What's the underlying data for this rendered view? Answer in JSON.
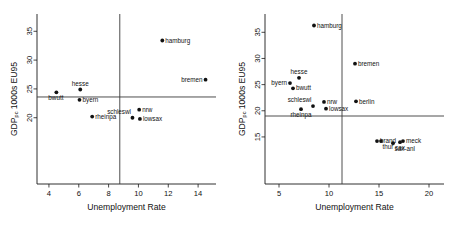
{
  "figure": {
    "panel_count": 2,
    "background_color": "#ffffff",
    "point_color": "#111111",
    "axis_color": "#1a1a1a",
    "refline_color": "#3a3a3a"
  },
  "chart_data": [
    {
      "type": "scatter",
      "panel": "left",
      "title": "",
      "xlabel": "Unemployment Rate",
      "ylabel": "GDP",
      "ylabel_sub": "pc",
      "ylabel_tail": " 1000s EU95",
      "ylabel_full": "GDP pc 1000s EU95",
      "xlim": [
        3.2,
        15.2
      ],
      "ylim": [
        8.5,
        38.0
      ],
      "xticks": [
        4,
        6,
        8,
        10,
        12,
        14
      ],
      "yticks": [
        20,
        25,
        30,
        35
      ],
      "grid": false,
      "legend": "none",
      "reference_lines": {
        "vertical_x": 8.75,
        "horizontal_y": 23.6
      },
      "points": [
        {
          "label": "bwutt",
          "x": 4.5,
          "y": 24.4,
          "label_pos": "below-left"
        },
        {
          "label": "byern",
          "x": 6.05,
          "y": 23.1,
          "label_pos": "right"
        },
        {
          "label": "hesse",
          "x": 6.1,
          "y": 24.9,
          "label_pos": "above"
        },
        {
          "label": "rheinpa",
          "x": 6.9,
          "y": 20.2,
          "label_pos": "right"
        },
        {
          "label": "schleswl",
          "x": 9.6,
          "y": 20.0,
          "label_pos": "above-left"
        },
        {
          "label": "nrw",
          "x": 10.05,
          "y": 21.4,
          "label_pos": "right"
        },
        {
          "label": "lowsax",
          "x": 10.1,
          "y": 19.8,
          "label_pos": "right"
        },
        {
          "label": "hamburg",
          "x": 11.6,
          "y": 33.4,
          "label_pos": "right"
        },
        {
          "label": "bremen",
          "x": 14.5,
          "y": 26.6,
          "label_pos": "left"
        }
      ]
    },
    {
      "type": "scatter",
      "panel": "right",
      "title": "",
      "xlabel": "Unemployment Rate",
      "ylabel": "GDP",
      "ylabel_sub": "pc",
      "ylabel_tail": " 1000s EU95",
      "ylabel_full": "GDP pc 1000s EU95",
      "xlim": [
        3.6,
        21.5
      ],
      "ylim": [
        6.0,
        38.5
      ],
      "xticks": [
        5,
        10,
        15,
        20
      ],
      "yticks": [
        15,
        20,
        25,
        30,
        35
      ],
      "grid": false,
      "legend": "none",
      "reference_lines": {
        "vertical_x": 11.3,
        "horizontal_y": 19.0
      },
      "points": [
        {
          "label": "byern",
          "x": 6.1,
          "y": 25.3,
          "label_pos": "left"
        },
        {
          "label": "bwutt",
          "x": 6.4,
          "y": 24.3,
          "label_pos": "right"
        },
        {
          "label": "hesse",
          "x": 7.0,
          "y": 26.3,
          "label_pos": "above"
        },
        {
          "label": "rheinpa",
          "x": 7.2,
          "y": 20.3,
          "label_pos": "below"
        },
        {
          "label": "schleswl",
          "x": 8.4,
          "y": 20.9,
          "label_pos": "above-left"
        },
        {
          "label": "hamburg",
          "x": 8.5,
          "y": 36.3,
          "label_pos": "right"
        },
        {
          "label": "nrw",
          "x": 9.5,
          "y": 21.7,
          "label_pos": "right"
        },
        {
          "label": "lowsax",
          "x": 9.7,
          "y": 20.4,
          "label_pos": "right"
        },
        {
          "label": "bremen",
          "x": 12.6,
          "y": 29.0,
          "label_pos": "right"
        },
        {
          "label": "berlin",
          "x": 12.7,
          "y": 21.8,
          "label_pos": "right"
        },
        {
          "label": "brand",
          "x": 14.8,
          "y": 14.2,
          "label_pos": "right"
        },
        {
          "label": "thur",
          "x": 15.2,
          "y": 14.2,
          "label_pos": "below-right"
        },
        {
          "label": "sax-anl",
          "x": 16.4,
          "y": 13.8,
          "label_pos": "below-right"
        },
        {
          "label": "sax",
          "x": 17.1,
          "y": 14.0,
          "label_pos": "below"
        },
        {
          "label": "meck",
          "x": 17.4,
          "y": 14.2,
          "label_pos": "right"
        }
      ]
    }
  ]
}
